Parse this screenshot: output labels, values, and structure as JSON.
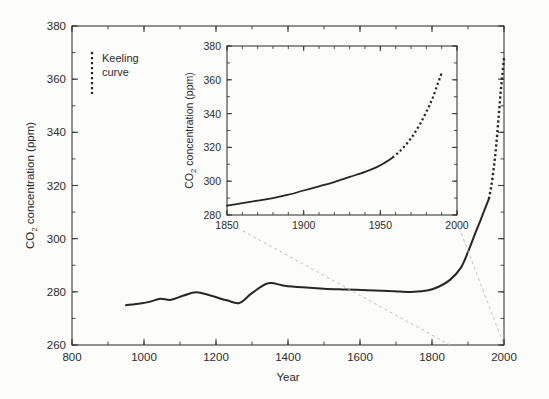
{
  "figure": {
    "background_color": "#fcfcfb",
    "line_color": "#262626",
    "axis_color": "#3a3a3a",
    "connector_color": "#b9b9b9"
  },
  "legend": {
    "name": "keeling-curve-legend",
    "line1": "Keeling",
    "line2": "curve",
    "style": "dotted-vertical"
  },
  "chart_data": [
    {
      "id": "main",
      "type": "line",
      "title": "",
      "xlabel": "Year",
      "ylabel": "CO2 concentration (ppm)",
      "ylabel_parts": {
        "pre": "CO",
        "sub": "2",
        "post": " concentration (ppm)"
      },
      "xlim": [
        800,
        2000
      ],
      "ylim": [
        260,
        380
      ],
      "xticks": [
        800,
        1000,
        1200,
        1400,
        1600,
        1800,
        2000
      ],
      "xtick_labels": [
        "800",
        "1000",
        "1200",
        "1400",
        "1600",
        "1800",
        "2000"
      ],
      "xminor_step": 100,
      "yticks": [
        260,
        280,
        300,
        320,
        340,
        360,
        380
      ],
      "ytick_labels": [
        "260",
        "280",
        "300",
        "320",
        "340",
        "360",
        "380"
      ],
      "yminor_step": 10,
      "grid": false,
      "frame": "box",
      "legend_position": "upper-left",
      "series": [
        {
          "name": "Ice core record",
          "style": "solid",
          "x": [
            950,
            990,
            1020,
            1045,
            1075,
            1110,
            1145,
            1180,
            1230,
            1265,
            1300,
            1345,
            1390,
            1440,
            1500,
            1560,
            1620,
            1680,
            1710,
            1750,
            1790,
            1820,
            1850,
            1880,
            1900,
            1920,
            1935,
            1945,
            1958
          ],
          "y": [
            275.0,
            275.6,
            276.4,
            277.4,
            277.0,
            278.6,
            279.8,
            278.8,
            276.8,
            275.8,
            279.5,
            283.2,
            282.3,
            281.7,
            281.2,
            280.9,
            280.6,
            280.3,
            280.1,
            280.0,
            280.6,
            282.0,
            284.5,
            289.0,
            295.0,
            302.0,
            307.0,
            310.5,
            315.0
          ]
        },
        {
          "name": "Keeling curve",
          "style": "dashed",
          "x": [
            1958,
            1965,
            1972,
            1978,
            1984,
            1990,
            1995,
            2000
          ],
          "y": [
            315.0,
            320.0,
            327.0,
            334.5,
            344.0,
            354.0,
            361.0,
            368.0
          ]
        }
      ]
    },
    {
      "id": "inset",
      "type": "line",
      "title": "",
      "xlabel": "",
      "ylabel": "CO2 concentration (ppm)",
      "ylabel_parts": {
        "pre": "CO",
        "sub": "2",
        "post": " concentration (ppm)"
      },
      "xlim": [
        1850,
        2000
      ],
      "ylim": [
        280,
        380
      ],
      "xticks": [
        1850,
        1900,
        1950,
        2000
      ],
      "xtick_labels": [
        "1850",
        "1900",
        "1950",
        "2000"
      ],
      "xminor_step": 10,
      "yticks": [
        280,
        300,
        320,
        340,
        360,
        380
      ],
      "ytick_labels": [
        "280",
        "300",
        "320",
        "340",
        "360",
        "380"
      ],
      "yminor_step": 10,
      "grid": false,
      "frame": "box",
      "series": [
        {
          "name": "Ice core record",
          "style": "solid",
          "x": [
            1850,
            1860,
            1870,
            1880,
            1890,
            1900,
            1910,
            1920,
            1930,
            1940,
            1948,
            1953,
            1958
          ],
          "y": [
            285.5,
            287.0,
            288.5,
            290.0,
            292.0,
            294.5,
            297.0,
            299.5,
            302.5,
            305.5,
            308.5,
            311.0,
            314.0
          ]
        },
        {
          "name": "Keeling curve",
          "style": "dashed",
          "x": [
            1958,
            1963,
            1968,
            1972,
            1976,
            1980,
            1984,
            1988,
            1990
          ],
          "y": [
            314.0,
            318.0,
            323.0,
            328.0,
            334.0,
            341.0,
            349.0,
            359.0,
            364.0
          ]
        }
      ]
    }
  ],
  "connectors": {
    "name": "inset-connector-lines",
    "description": "dashed guide lines linking inset corners to main axis year positions",
    "left": {
      "from_year": 1850,
      "to_year": 1850
    },
    "right": {
      "from_year": 2000,
      "to_year": 2000
    }
  }
}
